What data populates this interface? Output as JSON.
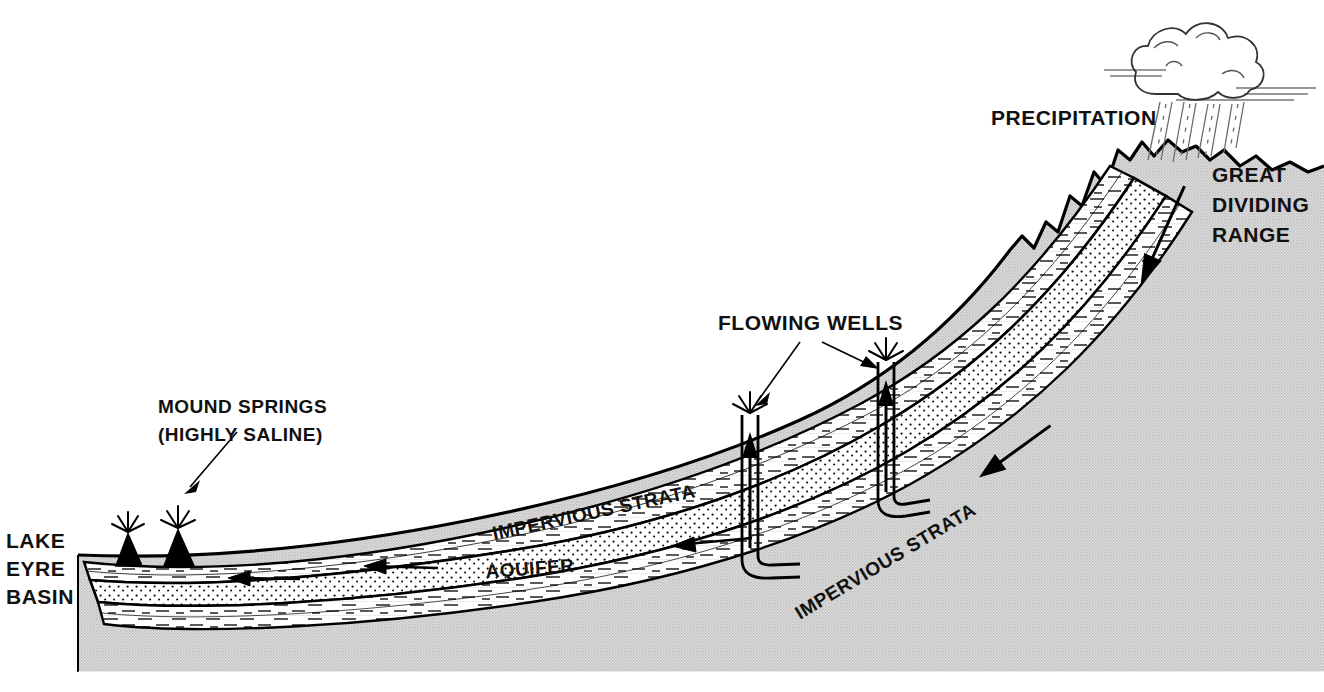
{
  "diagram": {
    "type": "geological-cross-section",
    "background_color": "#ffffff",
    "rock_fill_color": "#d2d2d2",
    "aquifer_fill_color": "#ffffff",
    "line_color": "#000000"
  },
  "labels": {
    "precipitation": "PRECIPITATION",
    "great_dividing_range_line1": "GREAT",
    "great_dividing_range_line2": "DIVIDING",
    "great_dividing_range_line3": "RANGE",
    "flowing_wells": "FLOWING WELLS",
    "mound_springs_line1": "MOUND SPRINGS",
    "mound_springs_line2": "(HIGHLY SALINE)",
    "lake_eyre_line1": "LAKE",
    "lake_eyre_line2": "EYRE",
    "lake_eyre_line3": "BASIN",
    "impervious_strata_upper": "IMPERVIOUS STRATA",
    "impervious_strata_lower": "IMPERVIOUS STRATA",
    "aquifer": "AQUIFER"
  },
  "features": {
    "cloud": "rain-cloud-icon",
    "rain": "rainfall-icon",
    "well_left": "flowing-well-icon",
    "well_right": "flowing-well-icon",
    "spring_left": "mound-spring-icon",
    "spring_right": "mound-spring-icon",
    "flow_arrows_count": 6
  }
}
